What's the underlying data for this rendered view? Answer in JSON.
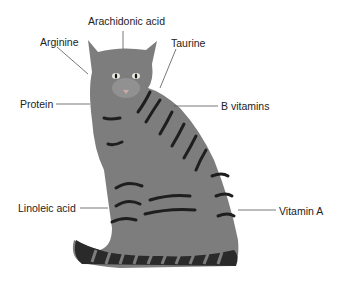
{
  "diagram": {
    "labels": [
      {
        "id": "arachidonic",
        "text": "Arachidonic acid",
        "x": 88,
        "y": 15
      },
      {
        "id": "arginine",
        "text": "Arginine",
        "x": 40,
        "y": 36
      },
      {
        "id": "taurine",
        "text": "Taurine",
        "x": 171,
        "y": 37
      },
      {
        "id": "protein",
        "text": "Protein",
        "x": 20,
        "y": 98
      },
      {
        "id": "bvitamins",
        "text": "B vitamins",
        "x": 221,
        "y": 100
      },
      {
        "id": "linoleic",
        "text": "Linoleic acid",
        "x": 18,
        "y": 202
      },
      {
        "id": "vitamina",
        "text": "Vitamin A",
        "x": 279,
        "y": 205
      }
    ],
    "colors": {
      "fur": "#7d7d7d",
      "stripe": "#1e1e1e",
      "leader_line": "#555555",
      "text": "#222222"
    }
  }
}
